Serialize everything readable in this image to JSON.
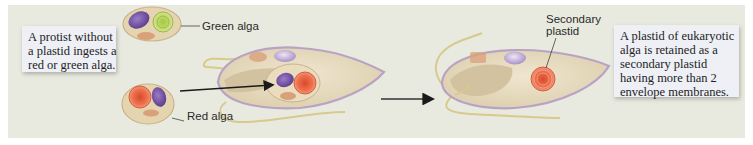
{
  "figure": {
    "type": "diagram",
    "colors": {
      "background": "#e8eadf",
      "callout_bg": "#eef0f6",
      "cell_fill": "#e6dcc4",
      "cell_outline": "#b9a3c4",
      "red_plastid": "#e8623a",
      "green_plastid": "#b7d45a",
      "purple_nucleus": "#7a55a8",
      "arrow": "#1a1a1a"
    }
  },
  "callouts": {
    "left": {
      "lines": [
        "A protist without",
        "a plastid ingests a",
        "red or green alga."
      ]
    },
    "right": {
      "lines": [
        "A plastid of eukaryotic",
        "alga is retained as a",
        "secondary plastid",
        "having more than 2",
        "envelope membranes."
      ]
    }
  },
  "labels": {
    "green_alga": "Green alga",
    "red_alga": "Red alga",
    "secondary_plastid_line1": "Secondary",
    "secondary_plastid_line2": "plastid"
  }
}
